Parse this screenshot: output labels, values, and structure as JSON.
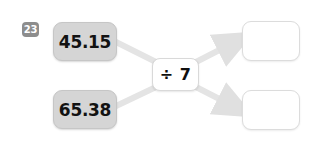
{
  "widget": {
    "type": "function-machine",
    "question_number": "23",
    "background_color": "#ffffff"
  },
  "colors": {
    "input_box_fill": "#d5d5d5",
    "badge_fill": "#8d8d8d",
    "arrow_stroke": "#e3e3e3",
    "text": "#121212"
  },
  "inputs": [
    {
      "label": "45.15"
    },
    {
      "label": "65.38"
    }
  ],
  "operator": {
    "symbol": "÷",
    "operand": "7",
    "label": "÷ 7"
  },
  "answers": [
    {
      "value": "",
      "placeholder": ""
    },
    {
      "value": "",
      "placeholder": ""
    }
  ],
  "arrows": [
    {
      "name": "arrow-input1-to-operator",
      "from": "45.15",
      "to": "÷ 7"
    },
    {
      "name": "arrow-input2-to-operator",
      "from": "65.38",
      "to": "÷ 7"
    },
    {
      "name": "arrow-operator-to-answer1",
      "from": "÷ 7",
      "to": "answer-1"
    },
    {
      "name": "arrow-operator-to-answer2",
      "from": "÷ 7",
      "to": "answer-2"
    }
  ]
}
